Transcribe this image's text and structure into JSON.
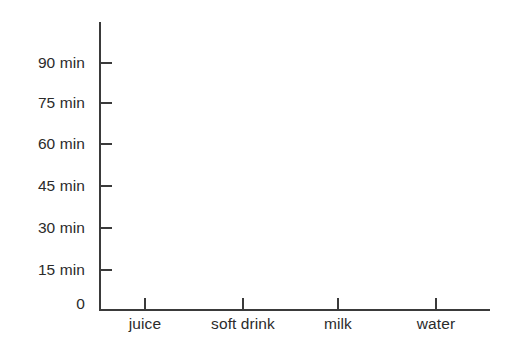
{
  "chart_data": {
    "type": "bar",
    "title": "",
    "subtitle": "",
    "xlabel": "",
    "ylabel": "",
    "categories": [
      "juice",
      "soft drink",
      "milk",
      "water"
    ],
    "values": [
      null,
      null,
      null,
      null
    ],
    "series": [],
    "ytick_labels": [
      "90 min",
      "75 min",
      "60 min",
      "45 min",
      "30 min",
      "15 min",
      "0"
    ],
    "ytick_values": [
      90,
      75,
      60,
      45,
      30,
      15,
      0
    ],
    "ylim": [
      0,
      97.5
    ],
    "y_unit": "min",
    "y_step": 15,
    "grid": false,
    "legend": false,
    "legend_position": "none",
    "annotations": [],
    "note": "Blank axes template — no data plotted"
  },
  "axes": {
    "line_color": "#3a3a3a",
    "text_color": "#2b2b2b",
    "background": "#ffffff",
    "y_ticks": [
      {
        "label": "90 min",
        "y": 63
      },
      {
        "label": "75 min",
        "y": 103
      },
      {
        "label": "60 min",
        "y": 144
      },
      {
        "label": "45 min",
        "y": 186
      },
      {
        "label": "30 min",
        "y": 228
      },
      {
        "label": "15 min",
        "y": 270
      },
      {
        "label": "0",
        "y": 304
      }
    ],
    "x_ticks": [
      {
        "label": "juice",
        "x": 145
      },
      {
        "label": "soft drink",
        "x": 243
      },
      {
        "label": "milk",
        "x": 338
      },
      {
        "label": "water",
        "x": 436
      }
    ]
  }
}
